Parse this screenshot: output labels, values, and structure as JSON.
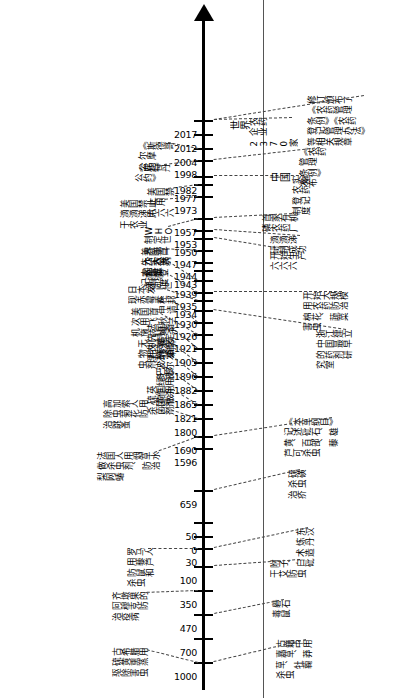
{
  "diagram": {
    "regions": {
      "china": "中国",
      "world": "世界"
    },
    "axis": {
      "orientation": "vertical-arrow-up",
      "ticks": [
        "1000",
        "700",
        "470",
        "350",
        "100",
        "30",
        "0",
        "50",
        "659",
        "1596",
        "1690",
        "1800",
        "1821",
        "1865",
        "1882",
        "1896",
        "1905",
        "1921",
        "1926",
        "1930",
        "1934",
        "1935",
        "1939",
        "1943",
        "1944",
        "1947",
        "1950",
        "1953",
        "1957",
        "1973",
        "1977",
        "1982",
        "1998",
        "2004",
        "2012",
        "2017"
      ]
    },
    "china_events": [
      {
        "year": "1000",
        "text": "古籍中用\n嘉草、莽\n草、牡蘜\n杀虫"
      },
      {
        "year": "350",
        "text": "礜石\n毒鼠"
      },
      {
        "year": "100",
        "text": "附子、\n干艾防虫"
      },
      {
        "year": "30",
        "text": "东汉\n炼丹\n术造\n白砒"
      },
      {
        "year": "659",
        "text": "硫磺\n杀虫\n治疥"
      },
      {
        "year": "1596",
        "text": "《本草纲目》\n记述砒石、雄\n黄、百部、藜\n芦可杀虫"
      },
      {
        "year": "1930",
        "text": "浙江建立\n中国最早\n的药剂研\n究室"
      },
      {
        "year": "1935",
        "text": "开始大规模\n用农药防治\n棉花、蔬菜\n害虫"
      },
      {
        "year": "1950",
        "text": "开始生产\n六六六"
      },
      {
        "year": "1951",
        "text": "滴滴涕\n研制成功"
      },
      {
        "year": "1957",
        "text": "首家有机\n磷农药厂"
      },
      {
        "year": "1982",
        "text": "实施\n农药\n登记\n制度"
      },
      {
        "year": "1997",
        "text": "《农药\n管理\n条例》\n发布"
      },
      {
        "year": "2017",
        "text": "修订颁布了\n《农药管理\n条例》《农药\n登记管理办法》\n等相关规章"
      },
      {
        "year": "2017b",
        "text": "农药\n企业\n2370家"
      }
    ],
    "world_events": [
      {
        "year": "1000",
        "text": "古希腊用\n硫黄熏蒸\n驱除害虫"
      },
      {
        "year": "470",
        "text": "齐墩果的\n阿穆克防\n治疫病"
      },
      {
        "year": "100",
        "text": "罗马人\n用藜芦\n防鼠和\n杀虫"
      },
      {
        "year": "1690",
        "text": "法国人用烟草水\n做杀虫剂、防治\n梨网蝽"
      },
      {
        "year": "1800",
        "text": "高加索人用\n除虫菊花防\n治跳蚤"
      },
      {
        "year": "1821",
        "text": "英国用\n硫黄做\n杀菌剂"
      },
      {
        "year": "1865",
        "text": "巴黎\n绿用\n作杀\n菌剂"
      },
      {
        "year": "1882",
        "text": "研发\n波尔\n多液"
      },
      {
        "year": "1896",
        "text": "无机氟化\n物用作杀\n虫剂"
      },
      {
        "year": "1905",
        "text": "法国首\n先制定\n农药管\n理法"
      },
      {
        "year": "1921",
        "text": "美国首\n次用飞\n机施药"
      },
      {
        "year": "1926",
        "text": "杜邦\n申请\n秋兰\n姆杀\n菌剂\n专利"
      },
      {
        "year": "1934",
        "text": "日本发\n现赤霉素"
      },
      {
        "year": "1939",
        "text": "滴滴\n涕问世"
      },
      {
        "year": "1943",
        "text": "六六六\n同世"
      },
      {
        "year": "1947",
        "text": "美国首\n先实施\n农药登\n记制度"
      },
      {
        "year": "1953",
        "text": "WHO\n制定世\n界第一\n个农药\n标准"
      },
      {
        "year": "1972",
        "text": "美国禁止\n滴滴涕用\n于农业"
      },
      {
        "year": "1977",
        "text": "美国禁\n止用\n六六六"
      },
      {
        "year": "1998",
        "text": "《鹿特丹\n公约》"
      },
      {
        "year": "2004",
        "text": "《斯德哥\n尔摩\n公约》"
      }
    ]
  }
}
